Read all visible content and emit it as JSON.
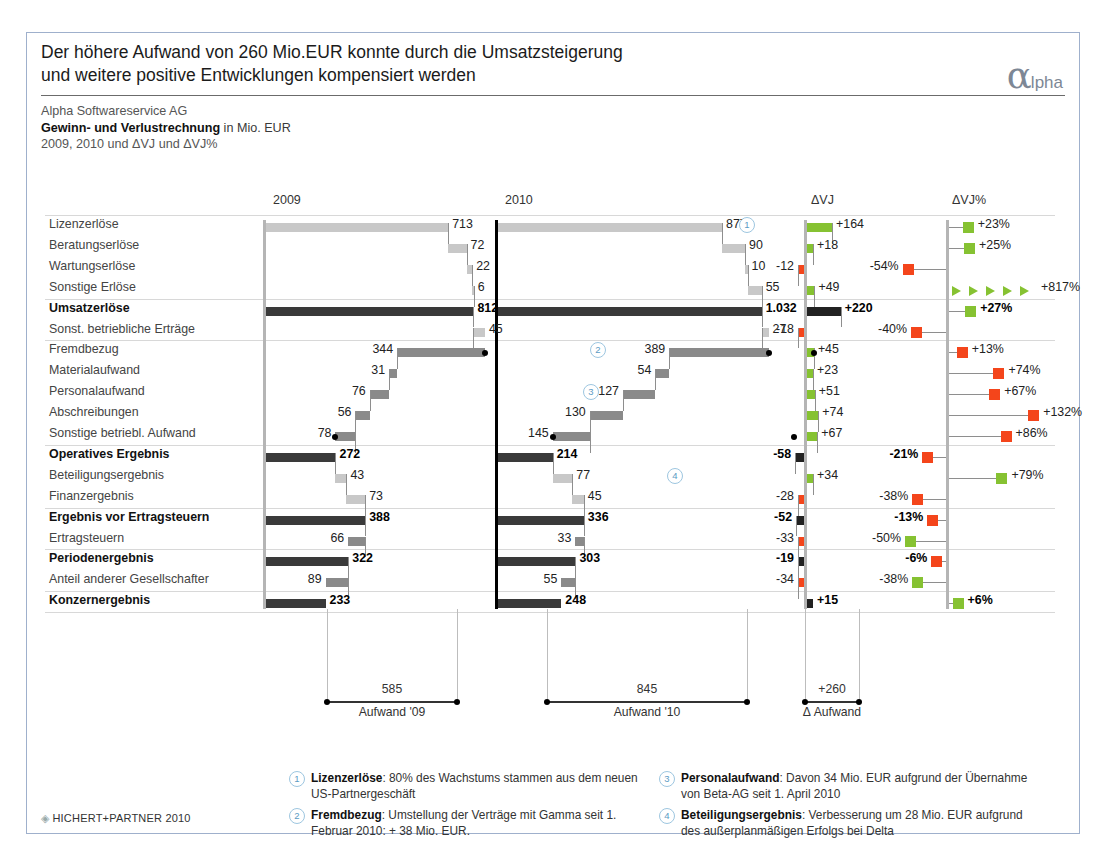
{
  "header": {
    "title_line1": "Der höhere Aufwand von 260 Mio.EUR konnte durch die Umsatzsteigerung",
    "title_line2": "und weitere positive Entwicklungen kompensiert werden",
    "logo_alpha": "α",
    "logo_rest": "lpha",
    "company": "Alpha Softwareservice AG",
    "statement_bold": "Gewinn- und Verlustrechnung",
    "statement_rest": " in Mio. EUR",
    "periods": "2009, 2010 und ΔVJ und ΔVJ%"
  },
  "columns": {
    "c1": "2009",
    "c2": "2010",
    "c3": "ΔVJ",
    "c4": "ΔVJ%"
  },
  "summary": {
    "s1_value": "585",
    "s1_label": "Aufwand '09",
    "s2_value": "845",
    "s2_label": "Aufwand '10",
    "s3_value": "+260",
    "s3_label": "Δ Aufwand"
  },
  "footnotes": [
    {
      "n": "1",
      "term": "Lizenzerlöse",
      "text": ": 80% des Wachstums stammen aus dem neuen US-Partnergeschäft"
    },
    {
      "n": "2",
      "term": "Fremdbezug",
      "text": ": Umstellung der Verträge mit Gamma seit 1. Februar 2010: + 38 Mio. EUR."
    },
    {
      "n": "3",
      "term": "Personalaufwand",
      "text": ": Davon 34 Mio. EUR aufgrund der Übernahme von Beta-AG seit 1. April 2010"
    },
    {
      "n": "4",
      "term": "Beteiligungsergebnis",
      "text": ": Verbesserung um 28 Mio. EUR aufgrund des außerplanmäßigen Erfolgs bei Delta"
    }
  ],
  "copyright": "HICHERT+PARTNER 2010",
  "colors": {
    "positive": "#86c232",
    "negative": "#f4451b",
    "sum": "#3a3a3a",
    "light": "#c8c8c8",
    "mid": "#8a8a8a",
    "accent": "#5b9bc4"
  },
  "chart_data": {
    "type": "bar",
    "title": "Gewinn- und Verlustrechnung in Mio. EUR",
    "subtitle": "2009, 2010 und ΔVJ und ΔVJ%",
    "xlabel": "",
    "ylabel": "",
    "categories": [
      "Lizenzerlöse",
      "Beratungserlöse",
      "Wartungserlöse",
      "Sonstige Erlöse",
      "Umsatzerlöse",
      "Sonst. betriebliche Erträge",
      "Fremdbezug",
      "Materialaufwand",
      "Personalaufwand",
      "Abschreibungen",
      "Sonstige betriebl. Aufwand",
      "Operatives Ergebnis",
      "Beteiligungsergebnis",
      "Finanzergebnis",
      "Ergebnis vor Ertragsteuern",
      "Ertragsteuern",
      "Periodenergebnis",
      "Anteil anderer Gesellschafter",
      "Konzernergebnis"
    ],
    "bold_rows": [
      "Umsatzerlöse",
      "Operatives Ergebnis",
      "Ergebnis vor Ertragsteuern",
      "Periodenergebnis",
      "Konzernergebnis"
    ],
    "series": [
      {
        "name": "2009",
        "values": [
          713,
          72,
          22,
          6,
          812,
          45,
          344,
          31,
          76,
          56,
          78,
          272,
          43,
          73,
          388,
          66,
          322,
          89,
          233
        ],
        "labels": [
          "713",
          "72",
          "22",
          "6",
          "812",
          "45",
          "344",
          "31",
          "76",
          "56",
          "78",
          "272",
          "43",
          "73",
          "388",
          "66",
          "322",
          "89",
          "233"
        ]
      },
      {
        "name": "2010",
        "values": [
          877,
          90,
          10,
          55,
          1032,
          27,
          389,
          54,
          127,
          130,
          145,
          214,
          77,
          45,
          336,
          33,
          303,
          55,
          248
        ],
        "labels": [
          "877",
          "90",
          "10",
          "55",
          "1.032",
          "27",
          "389",
          "54",
          "127",
          "130",
          "145",
          "214",
          "77",
          "45",
          "336",
          "33",
          "303",
          "55",
          "248"
        ]
      },
      {
        "name": "ΔVJ",
        "values": [
          164,
          18,
          -12,
          49,
          220,
          -18,
          45,
          23,
          51,
          74,
          67,
          -58,
          34,
          -28,
          -52,
          -33,
          -19,
          -34,
          15
        ],
        "labels": [
          "+164",
          "+18",
          "-12",
          "+49",
          "+220",
          "-18",
          "+45",
          "+23",
          "+51",
          "+74",
          "+67",
          "-58",
          "+34",
          "-28",
          "-52",
          "-33",
          "-19",
          "-34",
          "+15"
        ]
      },
      {
        "name": "ΔVJ%",
        "values": [
          23,
          25,
          -54,
          817,
          27,
          -40,
          13,
          74,
          67,
          132,
          86,
          -21,
          79,
          -38,
          -13,
          -50,
          -6,
          -38,
          6
        ],
        "labels": [
          "+23%",
          "+25%",
          "-54%",
          "+817%",
          "+27%",
          "-40%",
          "+13%",
          "+74%",
          "+67%",
          "+132%",
          "+86%",
          "-21%",
          "+79%",
          "-38%",
          "-13%",
          "-50%",
          "-6%",
          "-38%",
          "+6%"
        ]
      }
    ],
    "annotations": [
      {
        "row": "Lizenzerlöse",
        "marker": "1",
        "column": "2010"
      },
      {
        "row": "Fremdbezug",
        "marker": "2",
        "column": "2010"
      },
      {
        "row": "Personalaufwand",
        "marker": "3",
        "column": "2010"
      },
      {
        "row": "Beteiligungsergebnis",
        "marker": "4",
        "column": "2010"
      }
    ],
    "totals": {
      "Aufwand '09": 585,
      "Aufwand '10": 845,
      "Δ Aufwand": 260
    },
    "grid": true,
    "legend": "none"
  }
}
